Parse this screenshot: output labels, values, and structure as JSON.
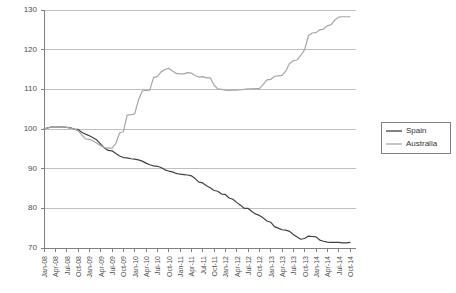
{
  "chart_data": {
    "type": "line",
    "title": "",
    "subtitle": "",
    "xlabel": "",
    "ylabel": "",
    "ylim": [
      70,
      130
    ],
    "yticks": [
      70,
      80,
      90,
      100,
      110,
      120,
      130
    ],
    "grid": "horizontal",
    "legend_position": "right",
    "legend": [
      "Spain",
      "Australia"
    ],
    "colors": {
      "spain": "#404040",
      "australia": "#a6a6a6",
      "grid": "#bfbfbf",
      "axis": "#808080",
      "text": "#4d4d4d",
      "legend_border": "#808080",
      "background": "#ffffff"
    },
    "x_tick_labels": [
      "Jan-08",
      "Apr-08",
      "Jul-08",
      "Oct-08",
      "Jan-09",
      "Apr-09",
      "Jul-09",
      "Oct-09",
      "Jan-10",
      "Apr-10",
      "Jul-10",
      "Oct-10",
      "Jan-11",
      "Apr-11",
      "Jul-11",
      "Oct-11",
      "Jan-12",
      "Apr-12",
      "Jul-12",
      "Oct-12",
      "Jan-13",
      "Apr-13",
      "Jul-13",
      "Oct-13",
      "Jan-14",
      "Apr-14",
      "Jul-14",
      "Oct-14"
    ],
    "x_months": [
      "Jan-08",
      "Feb-08",
      "Mar-08",
      "Apr-08",
      "May-08",
      "Jun-08",
      "Jul-08",
      "Aug-08",
      "Sep-08",
      "Oct-08",
      "Nov-08",
      "Dec-08",
      "Jan-09",
      "Feb-09",
      "Mar-09",
      "Apr-09",
      "May-09",
      "Jun-09",
      "Jul-09",
      "Aug-09",
      "Sep-09",
      "Oct-09",
      "Nov-09",
      "Dec-09",
      "Jan-10",
      "Feb-10",
      "Mar-10",
      "Apr-10",
      "May-10",
      "Jun-10",
      "Jul-10",
      "Aug-10",
      "Sep-10",
      "Oct-10",
      "Nov-10",
      "Dec-10",
      "Jan-11",
      "Feb-11",
      "Mar-11",
      "Apr-11",
      "May-11",
      "Jun-11",
      "Jul-11",
      "Aug-11",
      "Sep-11",
      "Oct-11",
      "Nov-11",
      "Dec-11",
      "Jan-12",
      "Feb-12",
      "Mar-12",
      "Apr-12",
      "May-12",
      "Jun-12",
      "Jul-12",
      "Aug-12",
      "Sep-12",
      "Oct-12",
      "Nov-12",
      "Dec-12",
      "Jan-13",
      "Feb-13",
      "Mar-13",
      "Apr-13",
      "May-13",
      "Jun-13",
      "Jul-13",
      "Aug-13",
      "Sep-13",
      "Oct-13",
      "Nov-13",
      "Dec-13",
      "Jan-14",
      "Feb-14",
      "Mar-14",
      "Apr-14",
      "May-14",
      "Jun-14",
      "Jul-14",
      "Aug-14",
      "Sep-14",
      "Oct-14"
    ],
    "series": [
      {
        "name": "Spain",
        "color": "#404040",
        "values": [
          100.0,
          100.3,
          100.5,
          100.5,
          100.5,
          100.5,
          100.4,
          100.3,
          100.0,
          99.9,
          99.2,
          98.7,
          98.3,
          97.8,
          97.2,
          96.2,
          95.2,
          94.6,
          94.5,
          93.8,
          93.2,
          92.8,
          92.7,
          92.5,
          92.4,
          92.2,
          91.9,
          91.4,
          91.0,
          90.7,
          90.6,
          90.3,
          89.7,
          89.4,
          89.2,
          88.8,
          88.6,
          88.5,
          88.4,
          88.2,
          87.5,
          86.6,
          86.4,
          85.7,
          85.2,
          84.5,
          84.3,
          83.6,
          83.5,
          82.6,
          82.3,
          81.5,
          80.8,
          80.0,
          80.0,
          79.2,
          78.6,
          78.2,
          77.6,
          76.8,
          76.5,
          75.4,
          75.0,
          74.6,
          74.5,
          74.2,
          73.4,
          72.8,
          72.2,
          72.4,
          73.0,
          72.9,
          72.8,
          72.0,
          71.7,
          71.5,
          71.4,
          71.4,
          71.4,
          71.3,
          71.3,
          71.4
        ]
      },
      {
        "name": "Australia",
        "color": "#a6a6a6",
        "values": [
          100.0,
          100.3,
          100.5,
          100.6,
          100.6,
          100.5,
          100.4,
          100.2,
          100.0,
          99.6,
          98.5,
          97.5,
          97.4,
          97.0,
          96.4,
          95.8,
          95.3,
          95.2,
          95.2,
          96.3,
          99.0,
          99.3,
          103.5,
          103.6,
          103.8,
          107.3,
          109.6,
          109.7,
          109.8,
          113.0,
          113.2,
          114.4,
          115.0,
          115.3,
          114.6,
          114.0,
          113.9,
          113.9,
          114.2,
          114.1,
          113.5,
          113.1,
          113.2,
          112.9,
          112.9,
          111.1,
          110.1,
          110.0,
          109.8,
          109.7,
          109.8,
          109.8,
          109.9,
          110.0,
          110.1,
          110.1,
          110.2,
          110.2,
          111.2,
          112.4,
          112.5,
          113.3,
          113.4,
          113.5,
          114.6,
          116.5,
          117.2,
          117.4,
          118.6,
          120.0,
          123.5,
          124.2,
          124.3,
          125.0,
          125.2,
          126.0,
          126.3,
          127.5,
          128.2,
          128.3,
          128.3,
          128.3
        ]
      }
    ]
  }
}
